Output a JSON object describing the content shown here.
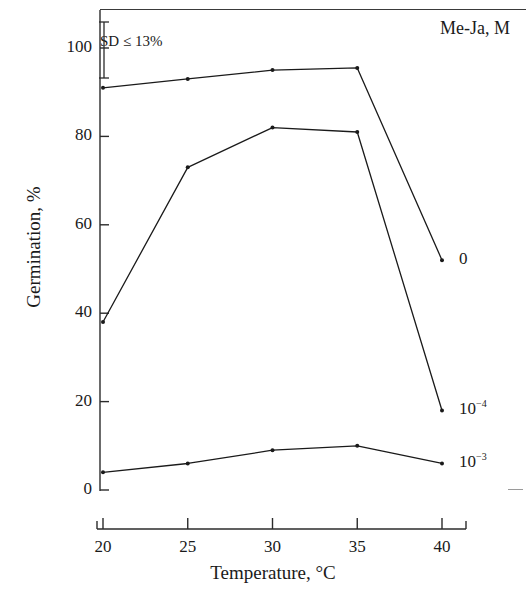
{
  "figure": {
    "legend_title": "Me-Ja, M",
    "sd_note": "SD ≤ 13%"
  },
  "chart_data": {
    "type": "line",
    "title": "",
    "xlabel": "Temperature, °C",
    "ylabel": "Germination, %",
    "x": [
      20,
      25,
      30,
      35,
      40
    ],
    "xticklabels": [
      "20",
      "25",
      "30",
      "35",
      "40"
    ],
    "yticks": [
      0,
      20,
      40,
      60,
      80,
      100
    ],
    "yticklabels": [
      "0",
      "20",
      "40",
      "60",
      "80",
      "100"
    ],
    "xlim": [
      20,
      40
    ],
    "ylim": [
      0,
      100
    ],
    "grid": false,
    "legend_position": "right-of-line-ends",
    "legend_title": "Me-Ja, M",
    "annotations": [
      {
        "text": "SD ≤ 13%",
        "kind": "error-bar-note",
        "bar_from": 102,
        "bar_to": 85
      }
    ],
    "series": [
      {
        "name": "0",
        "label_html": "0",
        "values": [
          91,
          93,
          95,
          95.5,
          52
        ],
        "color": "#1a1a1a",
        "marker": "dot"
      },
      {
        "name": "10^-4",
        "label_base": "10",
        "label_exponent": "−4",
        "values": [
          38,
          73,
          82,
          81,
          18
        ],
        "color": "#1a1a1a",
        "marker": "dot"
      },
      {
        "name": "10^-3",
        "label_base": "10",
        "label_exponent": "−3",
        "values": [
          4,
          6,
          9,
          10,
          6
        ],
        "color": "#1a1a1a",
        "marker": "dot"
      }
    ]
  }
}
